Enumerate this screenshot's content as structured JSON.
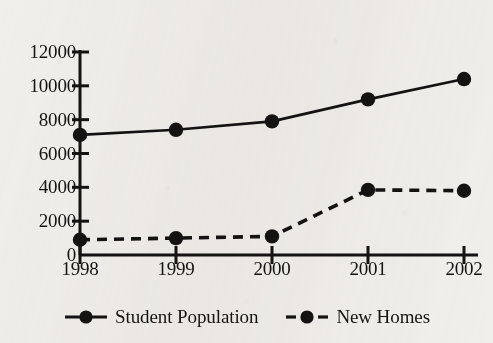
{
  "chart_data": {
    "type": "line",
    "title": "",
    "xlabel": "",
    "ylabel": "",
    "categories": [
      "1998",
      "1999",
      "2000",
      "2001",
      "2002"
    ],
    "x": [
      1998,
      1999,
      2000,
      2001,
      2002
    ],
    "ylim": [
      0,
      12000
    ],
    "ytick_values": [
      0,
      2000,
      4000,
      6000,
      8000,
      10000,
      12000
    ],
    "ytick_labels": [
      "0",
      "2000",
      "4000",
      "6000",
      "8000",
      "10000",
      "12000"
    ],
    "grid": false,
    "legend_position": "bottom",
    "series": [
      {
        "name": "Student Population",
        "values": [
          7100,
          7400,
          7900,
          9200,
          10400
        ],
        "line_style": "solid",
        "marker": "circle",
        "color": "#141312"
      },
      {
        "name": "New Homes",
        "values": [
          900,
          1000,
          1100,
          3850,
          3800
        ],
        "line_style": "dashed",
        "marker": "circle",
        "color": "#141312"
      }
    ]
  },
  "legend": {
    "entries": [
      {
        "label": "Student Population",
        "style": "solid-line-with-dot"
      },
      {
        "label": "New Homes",
        "style": "dashed-line-with-dot"
      }
    ]
  },
  "colors": {
    "background": "#f1efec",
    "ink": "#141312"
  }
}
